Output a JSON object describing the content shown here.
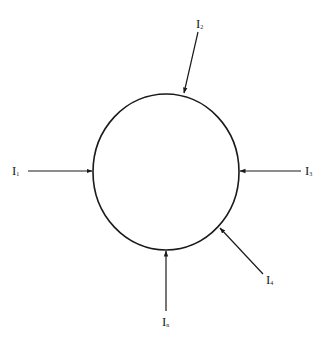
{
  "diagram": {
    "title": "",
    "node": {
      "shape": "circle",
      "stroke": "#1a1a1a"
    },
    "currents": [
      {
        "id": "left",
        "symbol": "I",
        "subscript": "1",
        "direction": "into-node"
      },
      {
        "id": "top",
        "symbol": "I",
        "subscript": "2",
        "direction": "into-node"
      },
      {
        "id": "right",
        "symbol": "I",
        "subscript": "3",
        "direction": "into-node"
      },
      {
        "id": "lower-right",
        "symbol": "I",
        "subscript": "4",
        "direction": "into-node"
      },
      {
        "id": "bottom",
        "symbol": "I",
        "subscript": "n",
        "direction": "into-node"
      }
    ]
  }
}
